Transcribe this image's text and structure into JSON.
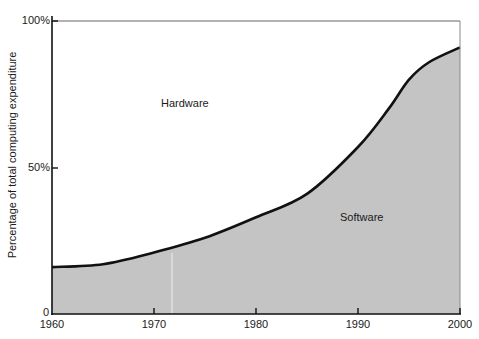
{
  "chart_data": {
    "type": "area",
    "title": "",
    "xlabel": "",
    "ylabel": "Percentage of total computing expenditure",
    "x": [
      1960,
      1965,
      1970,
      1975,
      1980,
      1985,
      1990,
      1993,
      1995,
      1997,
      2000
    ],
    "series": [
      {
        "name": "Software",
        "values": [
          16,
          17,
          21,
          26,
          33,
          41,
          57,
          70,
          80,
          86,
          91
        ],
        "color": "#c4c4c4"
      },
      {
        "name": "Hardware",
        "values": [
          84,
          83,
          79,
          74,
          67,
          59,
          43,
          30,
          20,
          14,
          9
        ],
        "color": "#ffffff"
      }
    ],
    "xlim": [
      1960,
      2000
    ],
    "ylim": [
      0,
      100
    ],
    "x_ticks": [
      "1960",
      "1970",
      "1980",
      "1990",
      "2000"
    ],
    "y_ticks": [
      "0",
      "50%",
      "100%"
    ],
    "annotations": [
      "Hardware",
      "Software"
    ],
    "grid": false,
    "legend": "none (inline area labels)"
  },
  "labels": {
    "ylabel": "Percentage of total computing expenditure",
    "hardware": "Hardware",
    "software": "Software",
    "y0": "0",
    "y50": "50%",
    "y100": "100%",
    "x1960": "1960",
    "x1970": "1970",
    "x1980": "1980",
    "x1990": "1990",
    "x2000": "2000"
  }
}
